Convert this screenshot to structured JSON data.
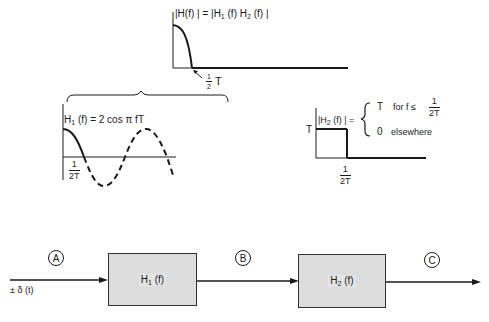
{
  "top_plot": {
    "title_lhs": "|H(f) | =",
    "title_rhs": "|H",
    "title_full": "|H(f) | = |H1 (f) H2 (f) |",
    "parts": [
      "|H(f) | = |H",
      "1",
      " (f) H",
      "2",
      " (f) |"
    ],
    "cutoff_num": "1",
    "cutoff_den": "2",
    "cutoff_suffix": "T"
  },
  "h1_plot": {
    "label_parts": [
      "H",
      "1",
      " (f) = 2 cos π fT"
    ],
    "tick_num": "1",
    "tick_den": "2T"
  },
  "h2_plot": {
    "label_parts": [
      "|H",
      "2",
      " (f) | ="
    ],
    "level_label": "T",
    "case1_value": "T",
    "case1_cond": "for f ≤",
    "case1_num": "1",
    "case1_den": "2T",
    "case2_value": "0",
    "case2_cond": "elsewhere",
    "tick_num": "1",
    "tick_den": "2T"
  },
  "block_diagram": {
    "input_label": "± δ (t)",
    "points": [
      "A",
      "B",
      "C"
    ],
    "blocks": [
      {
        "parts": [
          "H",
          "1",
          " (f)"
        ]
      },
      {
        "parts": [
          "H",
          "2",
          " (f)"
        ]
      }
    ]
  }
}
